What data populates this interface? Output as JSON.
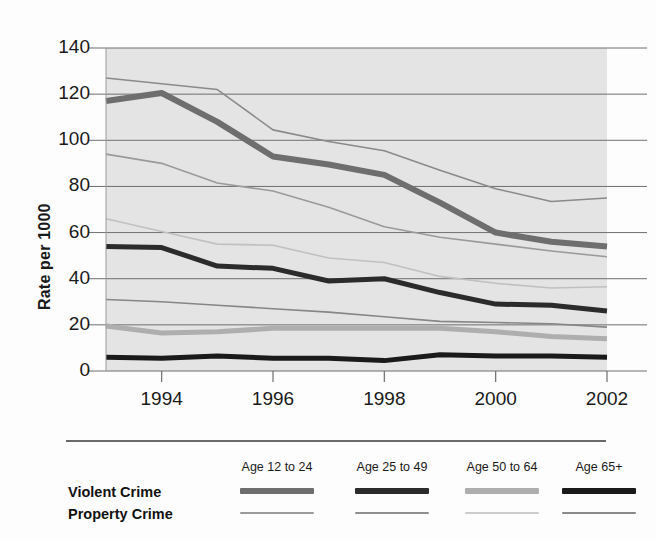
{
  "chart_data": {
    "type": "line",
    "title": "",
    "xlabel": "",
    "ylabel": "Rate per 1000",
    "x": [
      1993,
      1994,
      1995,
      1996,
      1997,
      1998,
      1999,
      2000,
      2001,
      2002
    ],
    "xlim": [
      1993,
      2002
    ],
    "ylim": [
      0,
      140
    ],
    "yticks": [
      0,
      20,
      40,
      60,
      80,
      100,
      120,
      140
    ],
    "xticks": [
      1994,
      1996,
      1998,
      2000,
      2002
    ],
    "xtick_labels": [
      "1994",
      "1996",
      "1998",
      "2000",
      "2002"
    ],
    "ytick_labels": [
      "0",
      "20",
      "40",
      "60",
      "80",
      "100",
      "120",
      "140"
    ],
    "grid": true,
    "grid_axis": "y",
    "plot_background": "#e4e4e4",
    "legend_position": "bottom",
    "series": [
      {
        "name": "Violent Crime - Age 12 to 24",
        "crime_type": "Violent Crime",
        "age_group": "Age 12 to 24",
        "color": "#6e6e6e",
        "width": 6,
        "values": [
          117,
          120.5,
          108,
          93,
          89.5,
          85,
          73,
          60,
          56,
          54
        ]
      },
      {
        "name": "Violent Crime - Age 25 to 49",
        "crime_type": "Violent Crime",
        "age_group": "Age 25 to 49",
        "color": "#2b2b2b",
        "width": 5,
        "values": [
          54,
          53.5,
          45.5,
          44.5,
          39,
          40,
          34,
          29,
          28.5,
          26
        ]
      },
      {
        "name": "Violent Crime - Age 50 to 64",
        "crime_type": "Violent Crime",
        "age_group": "Age 50 to 64",
        "color": "#aeaeae",
        "width": 5,
        "values": [
          19.5,
          16.5,
          17,
          18.5,
          18.5,
          18.5,
          18.5,
          17,
          15,
          14
        ]
      },
      {
        "name": "Violent Crime - Age 65+",
        "crime_type": "Violent Crime",
        "age_group": "Age 65+",
        "color": "#1a1a1a",
        "width": 5,
        "values": [
          6,
          5.5,
          6.5,
          5.5,
          5.5,
          4.5,
          7,
          6.5,
          6.5,
          6
        ]
      },
      {
        "name": "Property Crime - Age 12 to 24",
        "crime_type": "Property Crime",
        "age_group": "Age 12 to 24",
        "color": "#8a8a8a",
        "width": 1.6,
        "values": [
          127,
          124.5,
          122,
          104.5,
          99.5,
          95.5,
          87,
          79,
          73.5,
          75
        ]
      },
      {
        "name": "Property Crime - Age 25 to 49",
        "crime_type": "Property Crime",
        "age_group": "Age 25 to 49",
        "color": "#9a9a9a",
        "width": 1.6,
        "values": [
          94,
          90,
          81.5,
          78,
          71,
          62.5,
          58,
          55,
          52,
          49.5
        ]
      },
      {
        "name": "Property Crime - Age 50 to 64",
        "crime_type": "Property Crime",
        "age_group": "Age 50 to 64",
        "color": "#c0c0c0",
        "width": 1.6,
        "values": [
          66,
          60.5,
          55,
          54.5,
          49,
          47,
          41,
          38,
          36,
          36.5
        ]
      },
      {
        "name": "Property Crime - Age 65+",
        "crime_type": "Property Crime",
        "age_group": "Age 65+",
        "color": "#868686",
        "width": 1.6,
        "values": [
          31,
          30,
          28.5,
          27,
          25.5,
          23.5,
          21.5,
          21,
          20.5,
          19
        ]
      }
    ]
  },
  "axis": {
    "ylabel": "Rate per 1000"
  },
  "legend": {
    "columns": [
      "Age 12 to 24",
      "Age 25 to 49",
      "Age 50 to 64",
      "Age 65+"
    ],
    "rows": [
      {
        "label": "Violent Crime",
        "swatches": [
          {
            "color": "#6e6e6e",
            "height": 6
          },
          {
            "color": "#2b2b2b",
            "height": 6
          },
          {
            "color": "#aeaeae",
            "height": 6
          },
          {
            "color": "#1a1a1a",
            "height": 6
          }
        ]
      },
      {
        "label": "Property Crime",
        "swatches": [
          {
            "color": "#9a9a9a",
            "height": 2
          },
          {
            "color": "#8f8f8f",
            "height": 2
          },
          {
            "color": "#cccccc",
            "height": 2
          },
          {
            "color": "#8a8a8a",
            "height": 2
          }
        ]
      }
    ]
  }
}
